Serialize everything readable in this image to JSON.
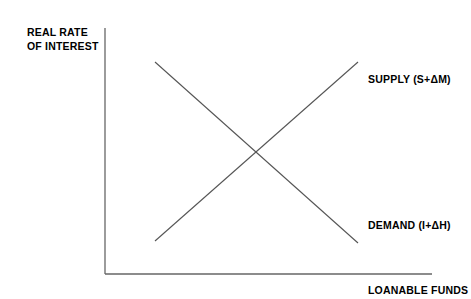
{
  "figure": {
    "background_color": "#ffffff",
    "line_color": "#555555",
    "axis_color": "#666666",
    "text_color": "#000000"
  },
  "axes": {
    "y_title_line1": "REAL RATE",
    "y_title_line2": "OF INTEREST",
    "x_title": "LOANABLE FUNDS",
    "origin": {
      "x": 105,
      "y": 274
    },
    "y_top": {
      "x": 105,
      "y": 28
    },
    "x_right": {
      "x": 432,
      "y": 274
    }
  },
  "curves": {
    "supply": {
      "label": "SUPPLY (S+ΔM)",
      "x1": 155,
      "y1": 241,
      "x2": 358,
      "y2": 62
    },
    "demand": {
      "label": "DEMAND (I+ΔH)",
      "x1": 155,
      "y1": 62,
      "x2": 358,
      "y2": 243
    },
    "intersection": {
      "x": 256,
      "y": 152
    }
  },
  "chart_data": {
    "type": "line",
    "title": "",
    "xlabel": "LOANABLE FUNDS",
    "ylabel": "REAL RATE OF INTEREST",
    "grid": false,
    "legend_position": "inline-right",
    "axis_ticks": {
      "x": [],
      "y": []
    },
    "series": [
      {
        "name": "SUPPLY (S+ΔM)",
        "slope": "upward",
        "points": [
          {
            "x": 0.25,
            "y": 0.13
          },
          {
            "x": 0.77,
            "y": 0.86
          }
        ]
      },
      {
        "name": "DEMAND (I+ΔH)",
        "slope": "downward",
        "points": [
          {
            "x": 0.25,
            "y": 0.86
          },
          {
            "x": 0.77,
            "y": 0.13
          }
        ]
      }
    ],
    "annotations": [
      {
        "text": "SUPPLY (S+ΔM)",
        "x": 0.82,
        "y": 0.8
      },
      {
        "text": "DEMAND (I+ΔH)",
        "x": 0.82,
        "y": 0.21
      },
      {
        "text": "LOANABLE FUNDS",
        "x": 0.82,
        "y": -0.06
      }
    ],
    "equilibrium": {
      "x": 0.51,
      "y": 0.5
    }
  }
}
